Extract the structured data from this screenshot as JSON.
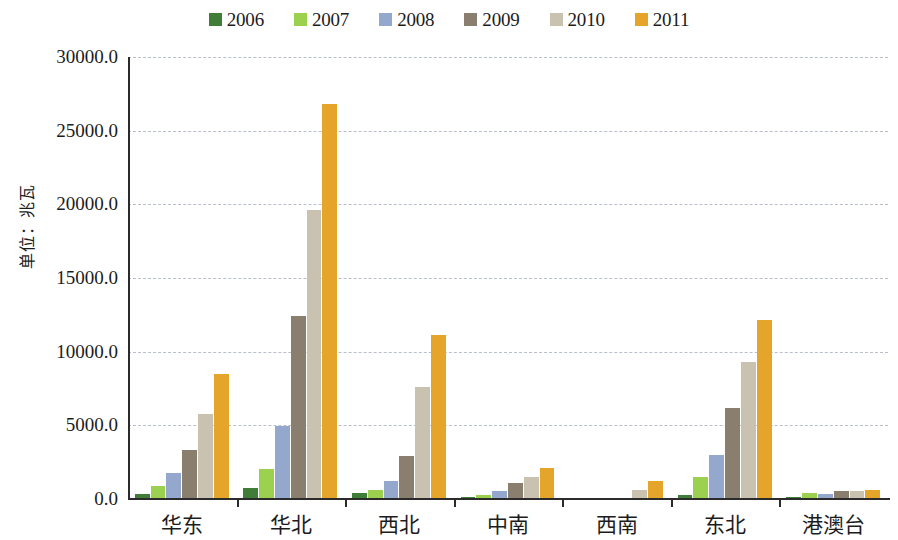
{
  "chart_data": {
    "type": "bar",
    "title": "",
    "subtitle": "",
    "xlabel": "",
    "ylabel": "单位：兆瓦",
    "ylim": [
      0,
      30000
    ],
    "ytick_labels": [
      "30000.0",
      "25000.0",
      "20000.0",
      "15000.0",
      "10000.0",
      "5000.0",
      "0.0"
    ],
    "ytick_values": [
      30000,
      25000,
      20000,
      15000,
      10000,
      5000,
      0
    ],
    "grid": true,
    "legend_position": "top-center",
    "categories": [
      "华东",
      "华北",
      "西北",
      "中南",
      "西南",
      "东北",
      "港澳台"
    ],
    "series": [
      {
        "name": "2006",
        "color": "#3f7d39",
        "values": [
          340,
          760,
          420,
          170,
          0,
          300,
          130
        ]
      },
      {
        "name": "2007",
        "color": "#9bd14e",
        "values": [
          870,
          2020,
          640,
          280,
          0,
          1500,
          430
        ]
      },
      {
        "name": "2008",
        "color": "#94a8ce",
        "values": [
          1760,
          4950,
          1220,
          570,
          0,
          3000,
          370
        ]
      },
      {
        "name": "2009",
        "color": "#8a7f6e",
        "values": [
          3350,
          12400,
          2900,
          1080,
          0,
          6200,
          530
        ]
      },
      {
        "name": "2010",
        "color": "#c9c2b0",
        "values": [
          5800,
          19650,
          7600,
          1500,
          600,
          9300,
          570
        ]
      },
      {
        "name": "2011",
        "color": "#e5a52a",
        "values": [
          8500,
          26800,
          11100,
          2120,
          1250,
          12150,
          580
        ]
      }
    ]
  },
  "legend": {
    "items": [
      {
        "label": "2006"
      },
      {
        "label": "2007"
      },
      {
        "label": "2008"
      },
      {
        "label": "2009"
      },
      {
        "label": "2010"
      },
      {
        "label": "2011"
      }
    ]
  },
  "axes": {
    "y_title": "单位：兆瓦"
  }
}
